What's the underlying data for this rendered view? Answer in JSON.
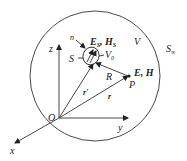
{
  "diagram": {
    "outer_surface_label": "S",
    "outer_surface_subscript": "∞",
    "volume_label": "V",
    "source_surface_label": "S",
    "source_volume_label": "V",
    "source_volume_subscript": "0",
    "normal_label": "n",
    "source_fields": {
      "E": "E",
      "E_sub": "S",
      "sep": ", ",
      "H": "H",
      "H_sub": "S"
    },
    "field_point_fields": "E, H",
    "field_point_label": "P",
    "distance_label": "R",
    "source_position_label": "r'",
    "field_position_label": "r",
    "origin_label": "O",
    "axes": {
      "x": "x",
      "y": "y",
      "z": "z"
    }
  }
}
